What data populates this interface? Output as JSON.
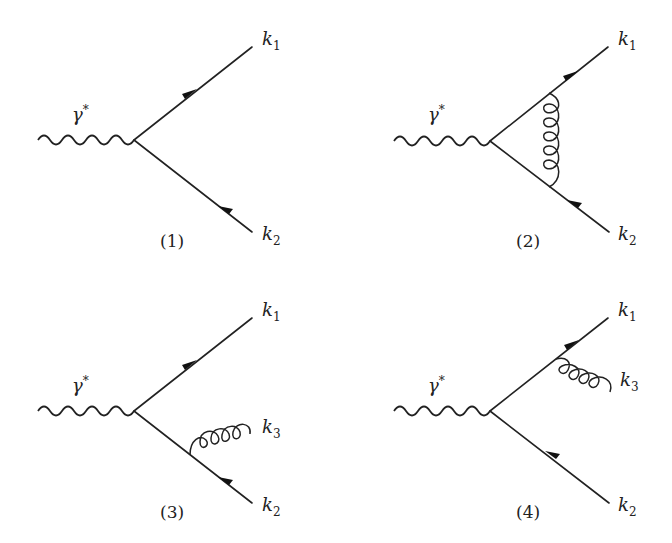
{
  "figure": {
    "type": "feynman-diagrams",
    "panels": [
      {
        "id": "1",
        "caption": "(1)",
        "incoming": {
          "symbol": "γ",
          "superscript": "*",
          "type": "photon"
        },
        "outgoing": [
          {
            "label": "k",
            "sub": "1",
            "type": "quark"
          },
          {
            "label": "k",
            "sub": "2",
            "type": "antiquark"
          }
        ],
        "gluon": "none"
      },
      {
        "id": "2",
        "caption": "(2)",
        "incoming": {
          "symbol": "γ",
          "superscript": "*",
          "type": "photon"
        },
        "outgoing": [
          {
            "label": "k",
            "sub": "1",
            "type": "quark"
          },
          {
            "label": "k",
            "sub": "2",
            "type": "antiquark"
          }
        ],
        "gluon": "vertex-loop"
      },
      {
        "id": "3",
        "caption": "(3)",
        "incoming": {
          "symbol": "γ",
          "superscript": "*",
          "type": "photon"
        },
        "outgoing": [
          {
            "label": "k",
            "sub": "1",
            "type": "quark"
          },
          {
            "label": "k",
            "sub": "3",
            "type": "gluon"
          },
          {
            "label": "k",
            "sub": "2",
            "type": "antiquark"
          }
        ],
        "gluon": "emission-from-k2"
      },
      {
        "id": "4",
        "caption": "(4)",
        "incoming": {
          "symbol": "γ",
          "superscript": "*",
          "type": "photon"
        },
        "outgoing": [
          {
            "label": "k",
            "sub": "1",
            "type": "quark"
          },
          {
            "label": "k",
            "sub": "3",
            "type": "gluon"
          },
          {
            "label": "k",
            "sub": "2",
            "type": "antiquark"
          }
        ],
        "gluon": "emission-from-k1"
      }
    ]
  },
  "colors": {
    "ink": "#222222",
    "background": "#ffffff"
  }
}
